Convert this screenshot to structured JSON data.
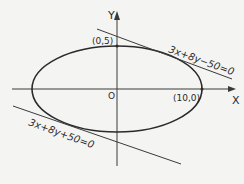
{
  "diagram": {
    "type": "ellipse-with-tangents",
    "axes": {
      "x_label": "X",
      "y_label": "Y",
      "origin_label": "O"
    },
    "points": [
      {
        "label": "(0,5)"
      },
      {
        "label": "(10,0)"
      }
    ],
    "tangents": [
      {
        "equation": "3x+8y−50=0"
      },
      {
        "equation": "3x+8y+50=0"
      }
    ],
    "colors": {
      "stroke": "#2a2a2a",
      "background": "#f4f4f2"
    }
  }
}
